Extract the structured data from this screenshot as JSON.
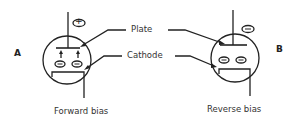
{
  "diagram": {
    "labels": {
      "plate": "Plate",
      "cathode": "Cathode"
    },
    "tube_a": {
      "side_label": "A",
      "caption": "Forward bias",
      "plate_polarity": "+",
      "electron_charge": "−"
    },
    "tube_b": {
      "side_label": "B",
      "caption": "Reverse bias",
      "plate_polarity": "−",
      "electron_charge": "−"
    },
    "colors": {
      "line": "#222222",
      "text": "#333333",
      "background": "#ffffff"
    }
  }
}
